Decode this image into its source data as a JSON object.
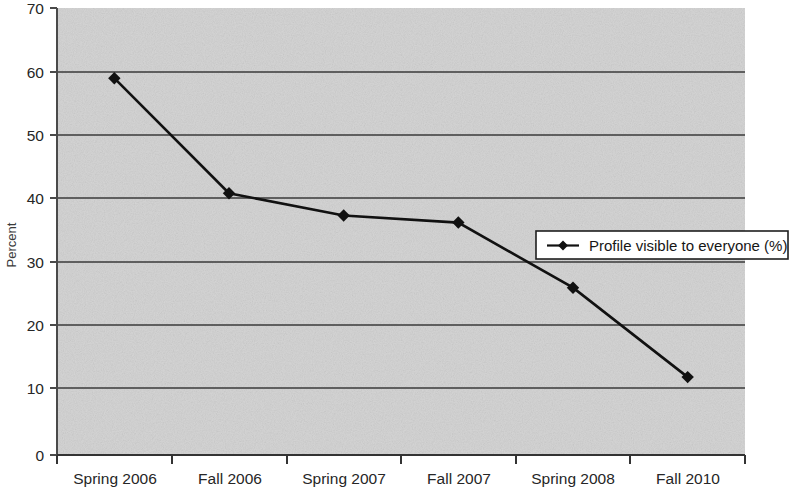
{
  "chart_data": {
    "type": "line",
    "title": "",
    "xlabel": "",
    "ylabel": "Percent",
    "categories": [
      "Spring 2006",
      "Fall 2006",
      "Spring 2007",
      "Fall 2007",
      "Spring 2008",
      "Fall 2010"
    ],
    "series": [
      {
        "name": "Profile visible to everyone (%)",
        "values": [
          59,
          41,
          37.5,
          36.4,
          26.2,
          12.2
        ],
        "marker": "diamond",
        "color": "#111111"
      }
    ],
    "ylim": [
      0,
      70
    ],
    "yticks": [
      0,
      10,
      20,
      30,
      40,
      50,
      60,
      70
    ],
    "ytick_labels": [
      "0",
      "10",
      "20",
      "30",
      "40",
      "50",
      "60",
      "70"
    ],
    "grid": "horizontal",
    "legend_position": "center-right",
    "plot_background": "#d5d5d5",
    "gridline_color": "#3a3a3a"
  },
  "legend": {
    "entries": [
      {
        "label": "Profile visible to everyone (%)",
        "marker": "diamond-line-marker"
      }
    ]
  }
}
